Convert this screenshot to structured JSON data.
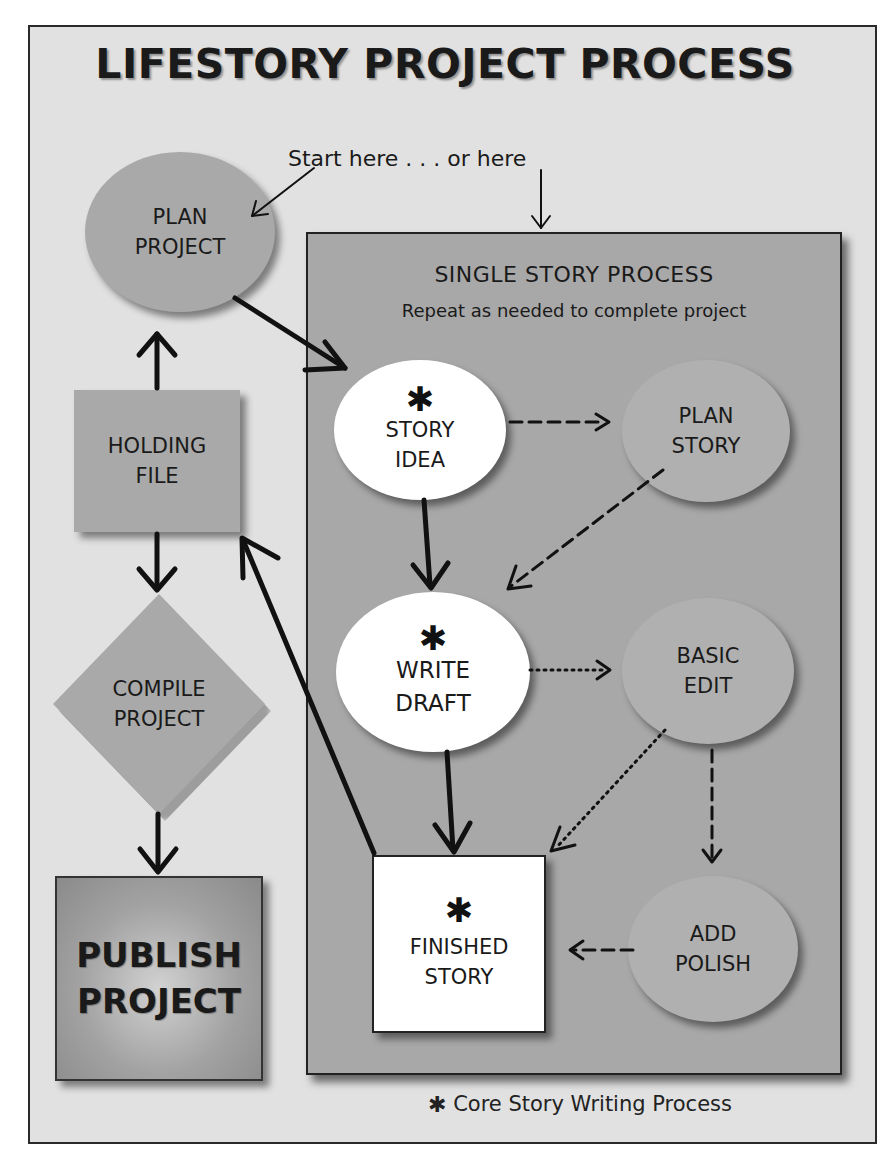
{
  "title": "LIFESTORY PROJECT PROCESS",
  "start_label": "Start here . . . or here",
  "single_story": {
    "title": "SINGLE STORY PROCESS",
    "subtitle": "Repeat as needed to complete project"
  },
  "nodes": {
    "plan_project": {
      "line1": "PLAN",
      "line2": "PROJECT",
      "shape": "ellipse"
    },
    "holding_file": {
      "line1": "HOLDING",
      "line2": "FILE",
      "shape": "square"
    },
    "compile_project": {
      "line1": "COMPILE",
      "line2": "PROJECT",
      "shape": "diamond"
    },
    "publish_project": {
      "line1": "PUBLISH",
      "line2": "PROJECT",
      "shape": "square"
    },
    "story_idea": {
      "marker": "✱",
      "line1": "STORY",
      "line2": "IDEA",
      "shape": "ellipse",
      "core": true
    },
    "plan_story": {
      "line1": "PLAN",
      "line2": "STORY",
      "shape": "ellipse"
    },
    "write_draft": {
      "marker": "✱",
      "line1": "WRITE",
      "line2": "DRAFT",
      "shape": "ellipse",
      "core": true
    },
    "basic_edit": {
      "line1": "BASIC",
      "line2": "EDIT",
      "shape": "ellipse"
    },
    "finished_story": {
      "marker": "✱",
      "line1": "FINISHED",
      "line2": "STORY",
      "shape": "square",
      "core": true
    },
    "add_polish": {
      "line1": "ADD",
      "line2": "POLISH",
      "shape": "ellipse"
    }
  },
  "edges": [
    {
      "from": "start_label",
      "to": "plan_project",
      "style": "thin"
    },
    {
      "from": "start_label",
      "to": "single_story_box",
      "style": "thin"
    },
    {
      "from": "plan_project",
      "to": "story_idea",
      "style": "solid"
    },
    {
      "from": "holding_file",
      "to": "plan_project",
      "style": "solid"
    },
    {
      "from": "holding_file",
      "to": "compile_project",
      "style": "solid"
    },
    {
      "from": "compile_project",
      "to": "publish_project",
      "style": "solid"
    },
    {
      "from": "finished_story",
      "to": "holding_file",
      "style": "solid"
    },
    {
      "from": "story_idea",
      "to": "plan_story",
      "style": "dashed"
    },
    {
      "from": "story_idea",
      "to": "write_draft",
      "style": "solid"
    },
    {
      "from": "plan_story",
      "to": "write_draft",
      "style": "dashed"
    },
    {
      "from": "write_draft",
      "to": "basic_edit",
      "style": "dotted"
    },
    {
      "from": "write_draft",
      "to": "finished_story",
      "style": "solid"
    },
    {
      "from": "basic_edit",
      "to": "finished_story",
      "style": "dotted"
    },
    {
      "from": "basic_edit",
      "to": "add_polish",
      "style": "dashed"
    },
    {
      "from": "add_polish",
      "to": "finished_story",
      "style": "dashed"
    }
  ],
  "footnote": {
    "marker": "✱",
    "text": "Core Story Writing Process"
  },
  "colors": {
    "frame_bg": "#e1e1e1",
    "inner_box_bg": "#a8a8a8",
    "node_gray": "#a9a9a9",
    "node_white": "#ffffff",
    "line": "#111111"
  }
}
